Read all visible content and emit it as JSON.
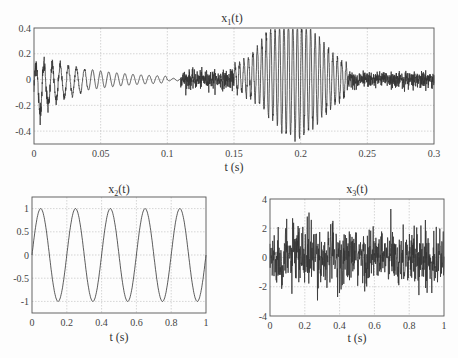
{
  "chart_data": [
    {
      "type": "line",
      "title": "x1(t)",
      "title_main": "x",
      "title_sub": "1",
      "title_tail": "(t)",
      "xlabel": "t (s)",
      "ylabel": "",
      "xlim": [
        0,
        0.3
      ],
      "ylim": [
        -0.5,
        0.4
      ],
      "xticks": [
        "0",
        "0.05",
        "0.1",
        "0.15",
        "0.2",
        "0.25",
        "0.3"
      ],
      "yticks": [
        "0.4",
        "0.2",
        "0",
        "-0.2",
        "-0.4"
      ],
      "grid": true,
      "description": "Decaying oscillation ~0.2 amplitude from 0 to 0.1 s, noise 0.11-0.15 s, large burst peaking ~±0.4 at 0.2 s, then low-level noise to 0.3 s",
      "segments": [
        {
          "t_start": 0.0,
          "t_end": 0.1,
          "kind": "decaying_sine",
          "amplitude_start": 0.2,
          "amplitude_end": 0.01,
          "freq_hz": 170
        },
        {
          "t_start": 0.11,
          "t_end": 0.15,
          "kind": "noise",
          "amplitude": 0.05
        },
        {
          "t_start": 0.15,
          "t_end": 0.23,
          "kind": "burst",
          "peak_amplitude": 0.42,
          "peak_time": 0.195,
          "freq_hz": 300
        },
        {
          "t_start": 0.23,
          "t_end": 0.3,
          "kind": "noise",
          "amplitude": 0.05
        }
      ]
    },
    {
      "type": "line",
      "title": "x2(t)",
      "title_main": "x",
      "title_sub": "2",
      "title_tail": "(t)",
      "xlabel": "t  (s)",
      "xlim": [
        0,
        1
      ],
      "ylim": [
        -1.25,
        1.25
      ],
      "xticks": [
        "0",
        "0.2",
        "0.4",
        "0.6",
        "0.8",
        "1"
      ],
      "yticks": [
        "1",
        "0.5",
        "0",
        "-0.5",
        "-1"
      ],
      "grid": true,
      "function": "sin(2*pi*5*t)",
      "frequency_hz": 5,
      "amplitude": 1
    },
    {
      "type": "line",
      "title": "x3(t)",
      "title_main": "x",
      "title_sub": "3",
      "title_tail": "(t)",
      "xlabel": "t  (s)",
      "xlim": [
        0,
        1
      ],
      "ylim": [
        -4,
        4
      ],
      "xticks": [
        "0",
        "0.2",
        "0.4",
        "0.6",
        "0.8",
        "1"
      ],
      "yticks": [
        "4",
        "2",
        "0",
        "-2",
        "-4"
      ],
      "grid": true,
      "description": "Random Gaussian noise, std ~1, extremes about +3.5 and -3.6",
      "std": 1.0
    }
  ]
}
